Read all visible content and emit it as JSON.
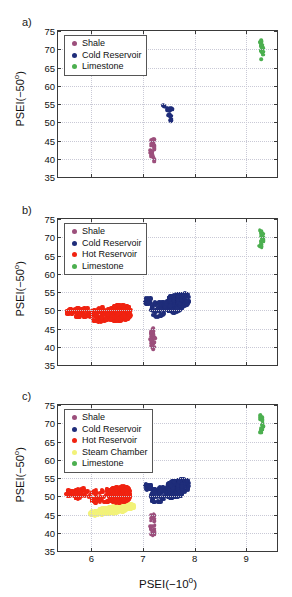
{
  "figure": {
    "panels": [
      {
        "label": "a)"
      },
      {
        "label": "b)"
      },
      {
        "label": "c)"
      }
    ]
  },
  "axes": {
    "xlabel_text": "PSEI(−10",
    "xlabel_sup": "o",
    "xlabel_tail": ")",
    "ylabel_text": "PSEI(−50",
    "ylabel_sup": "o",
    "ylabel_tail": ")",
    "xticks": [
      "6",
      "7",
      "8",
      "9"
    ],
    "yticks": [
      "35",
      "40",
      "45",
      "50",
      "55",
      "60",
      "65",
      "70",
      "75"
    ],
    "xlim": [
      5.35,
      9.6
    ],
    "ylim": [
      35,
      75
    ],
    "grid": "dotted"
  },
  "colors": {
    "shale": "#9c4f7c",
    "cold_reservoir": "#1f2d7a",
    "hot_reservoir": "#f02311",
    "steam_chamber": "#f2f279",
    "limestone": "#4caf50",
    "axis": "#3a3a3a",
    "grid": "#c9c9d6",
    "background": "#ffffff"
  },
  "legends": {
    "a": [
      {
        "label": "Shale",
        "color_key": "shale"
      },
      {
        "label": "Cold Reservoir",
        "color_key": "cold_reservoir"
      },
      {
        "label": "Limestone",
        "color_key": "limestone"
      }
    ],
    "b": [
      {
        "label": "Shale",
        "color_key": "shale"
      },
      {
        "label": "Cold Reservoir",
        "color_key": "cold_reservoir"
      },
      {
        "label": "Hot Reservoir",
        "color_key": "hot_reservoir"
      },
      {
        "label": "Limestone",
        "color_key": "limestone"
      }
    ],
    "c": [
      {
        "label": "Shale",
        "color_key": "shale"
      },
      {
        "label": "Cold Reservoir",
        "color_key": "cold_reservoir"
      },
      {
        "label": "Hot Reservoir",
        "color_key": "hot_reservoir"
      },
      {
        "label": "Steam Chamber",
        "color_key": "steam_chamber"
      },
      {
        "label": "Limestone",
        "color_key": "limestone"
      }
    ]
  },
  "chart_data": [
    {
      "type": "scatter",
      "panel": "a)",
      "title": "",
      "xlabel": "PSEI(−10o)",
      "ylabel": "PSEI(−50o)",
      "xlim": [
        5.35,
        9.6
      ],
      "ylim": [
        35,
        75
      ],
      "grid": true,
      "legend_position": "top-left",
      "series": [
        {
          "name": "Shale",
          "color": "#9c4f7c",
          "n": 34,
          "x_range": [
            7.13,
            7.26
          ],
          "y_range": [
            39.2,
            45.4
          ],
          "centroid": [
            7.19,
            41.9
          ]
        },
        {
          "name": "Cold Reservoir",
          "color": "#1f2d7a",
          "n": 26,
          "x_range": [
            7.33,
            7.62
          ],
          "y_range": [
            50.1,
            54.9
          ],
          "centroid": [
            7.47,
            53.0
          ]
        },
        {
          "name": "Limestone",
          "color": "#4caf50",
          "n": 30,
          "x_range": [
            9.25,
            9.38
          ],
          "y_range": [
            67.2,
            72.6
          ],
          "centroid": [
            9.31,
            70.0
          ]
        }
      ]
    },
    {
      "type": "scatter",
      "panel": "b)",
      "title": "",
      "xlabel": "PSEI(−10o)",
      "ylabel": "PSEI(−50o)",
      "xlim": [
        5.35,
        9.6
      ],
      "ylim": [
        35,
        75
      ],
      "grid": true,
      "legend_position": "top-left",
      "series": [
        {
          "name": "Shale",
          "color": "#9c4f7c",
          "n": 34,
          "x_range": [
            7.13,
            7.26
          ],
          "y_range": [
            39.3,
            45.2
          ],
          "centroid": [
            7.19,
            41.9
          ]
        },
        {
          "name": "Cold Reservoir",
          "color": "#1f2d7a",
          "n": 420,
          "x_range": [
            7.02,
            7.95
          ],
          "y_range": [
            46.8,
            55.2
          ],
          "centroid": [
            7.55,
            51.6
          ]
        },
        {
          "name": "Hot Reservoir",
          "color": "#f02311",
          "n": 430,
          "x_range": [
            5.5,
            7.12
          ],
          "y_range": [
            44.4,
            53.3
          ],
          "centroid": [
            6.35,
            49.0
          ]
        },
        {
          "name": "Limestone",
          "color": "#4caf50",
          "n": 30,
          "x_range": [
            9.25,
            9.38
          ],
          "y_range": [
            67.3,
            72.2
          ],
          "centroid": [
            9.31,
            69.7
          ]
        }
      ]
    },
    {
      "type": "scatter",
      "panel": "c)",
      "title": "",
      "xlabel": "PSEI(−10o)",
      "ylabel": "PSEI(−50o)",
      "xlim": [
        5.35,
        9.6
      ],
      "ylim": [
        35,
        75
      ],
      "grid": true,
      "legend_position": "top-left",
      "series": [
        {
          "name": "Shale",
          "color": "#9c4f7c",
          "n": 34,
          "x_range": [
            7.13,
            7.26
          ],
          "y_range": [
            39.2,
            45.2
          ],
          "centroid": [
            7.19,
            41.8
          ]
        },
        {
          "name": "Cold Reservoir",
          "color": "#1f2d7a",
          "n": 420,
          "x_range": [
            7.05,
            7.93
          ],
          "y_range": [
            46.3,
            55.3
          ],
          "centroid": [
            7.55,
            51.3
          ]
        },
        {
          "name": "Hot Reservoir",
          "color": "#f02311",
          "n": 330,
          "x_range": [
            5.52,
            7.0
          ],
          "y_range": [
            47.3,
            53.2
          ],
          "centroid": [
            6.35,
            50.3
          ]
        },
        {
          "name": "Steam Chamber",
          "color": "#f2f279",
          "n": 260,
          "x_range": [
            5.95,
            6.95
          ],
          "y_range": [
            44.3,
            48.8
          ],
          "centroid": [
            6.4,
            46.3
          ]
        },
        {
          "name": "Limestone",
          "color": "#4caf50",
          "n": 30,
          "x_range": [
            9.25,
            9.38
          ],
          "y_range": [
            67.3,
            72.4
          ],
          "centroid": [
            9.31,
            69.8
          ]
        }
      ]
    }
  ]
}
